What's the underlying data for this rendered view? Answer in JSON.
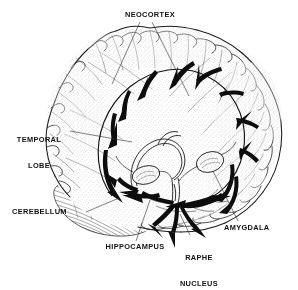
{
  "figure": {
    "view": "lateral-oblique right hemisphere, line-art engraving",
    "background_color": "#ffffff",
    "ink_color": "#111111",
    "stipple_color": "#6e6e6e",
    "labels": [
      {
        "id": "neocortex",
        "text": "NEOCORTEX",
        "lines": [
          "NEOCORTEX"
        ]
      },
      {
        "id": "temporal",
        "text": "TEMPORAL LOBE",
        "lines": [
          "TEMPORAL",
          "LOBE"
        ]
      },
      {
        "id": "cerebellum",
        "text": "CEREBELLUM",
        "lines": [
          "CEREBELLUM"
        ]
      },
      {
        "id": "hippocampus",
        "text": "HIPPOCAMPUS",
        "lines": [
          "HIPPOCAMPUS"
        ]
      },
      {
        "id": "raphe",
        "text": "RAPHE NUCLEUS",
        "lines": [
          "RAPHE",
          "NUCLEUS"
        ]
      },
      {
        "id": "amygdala",
        "text": "AMYGDALA",
        "lines": [
          "AMYGDALA"
        ]
      }
    ],
    "label_text": {
      "neocortex": "NEOCORTEX",
      "temporal_line1": "TEMPORAL",
      "temporal_line2": "LOBE",
      "cerebellum": "CEREBELLUM",
      "hippocampus": "HIPPOCAMPUS",
      "raphe_line1": "RAPHE",
      "raphe_line2": "NUCLEUS",
      "amygdala": "AMYGDALA"
    },
    "structures": [
      "cerebral cortex with gyri and sulci",
      "cerebellum with folia hatching",
      "hippocampal arch",
      "amygdala nuclei (left and right)",
      "raphe nucleus at brainstem"
    ],
    "pathways": "Bold black arrows radiate from the raphe nucleus along a large arching ring into the neocortex, hippocampus and amygdala."
  }
}
